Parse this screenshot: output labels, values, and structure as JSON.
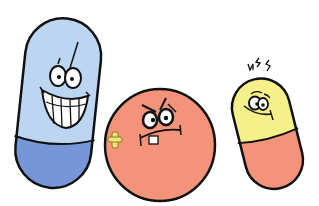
{
  "scene": {
    "description": "Three cartoon pill characters",
    "background": "#ffffff",
    "outline_color": "#111111"
  },
  "characters": [
    {
      "name": "blue-capsule",
      "expression": "big toothy grin",
      "top_color": "#bcd6f2",
      "bottom_color": "#7696d8"
    },
    {
      "name": "round-tablet",
      "expression": "angry with one buck tooth and bandage",
      "body_color": "#f3937a",
      "bandage_color": "#f2e37a"
    },
    {
      "name": "yellow-capsule",
      "expression": "dizzy and worried",
      "top_color": "#f6f08a",
      "bottom_color": "#f3937a",
      "effect": "dizzy squiggles"
    }
  ]
}
